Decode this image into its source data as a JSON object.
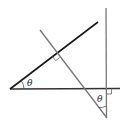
{
  "diagram": {
    "type": "geometry",
    "colors": {
      "dark_line": "#1a1a1a",
      "gray_line": "#777777",
      "mark": "#555555"
    },
    "labels": {
      "angle_left": "θ",
      "angle_bottom": "θ"
    },
    "elements": [
      "horizontal base line",
      "dark line rising from left vertex",
      "gray transversal perpendicular to dark line",
      "vertical line perpendicular to base",
      "right-angle marks at two perpendicular intersections",
      "angle arcs labeled theta"
    ]
  }
}
